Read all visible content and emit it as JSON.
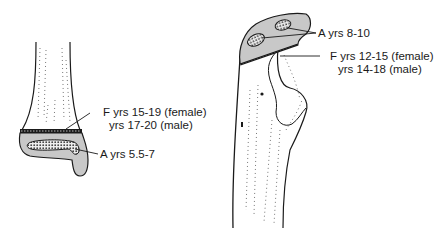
{
  "colors": {
    "ink": "#1a1a1a",
    "cartilage_fill": "#c8c8c8",
    "background": "#ffffff"
  },
  "left_figure": {
    "description": "distal long bone with epiphysis",
    "labels": {
      "fusion_line1": "F yrs 15-19 (female)",
      "fusion_line2": "yrs 17-20 (male)",
      "appearance": "A yrs 5.5-7"
    }
  },
  "right_figure": {
    "description": "proximal bone with two ossification centers",
    "labels": {
      "appearance": "A yrs 8-10",
      "fusion_line1": "F yrs 12-15 (female)",
      "fusion_line2": "yrs 14-18 (male)"
    }
  }
}
